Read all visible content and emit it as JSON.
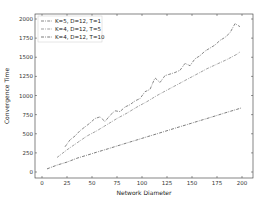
{
  "chart_data": {
    "type": "line",
    "title": "",
    "xlabel": "Network Diameter",
    "ylabel": "Convergence Time",
    "xlim": [
      -7,
      211
    ],
    "ylim": [
      -80,
      2000
    ],
    "xticks": [
      0,
      25,
      50,
      75,
      100,
      125,
      150,
      175,
      200
    ],
    "yticks": [
      0,
      250,
      500,
      750,
      1000,
      1250,
      1500,
      1750,
      2000
    ],
    "grid": false,
    "legend_position": "upper left",
    "series": [
      {
        "name": "K=5, D=12, T=1",
        "color": "#555555",
        "linestyle": "dashdot",
        "x": [
          23,
          28,
          33,
          38,
          43,
          48,
          53,
          58,
          63,
          68,
          73,
          78,
          83,
          88,
          93,
          98,
          103,
          108,
          113,
          118,
          123,
          128,
          133,
          138,
          143,
          148,
          153,
          158,
          163,
          168,
          173,
          178,
          183,
          188,
          193,
          198
        ],
        "y": [
          330,
          420,
          470,
          540,
          590,
          640,
          700,
          720,
          660,
          740,
          800,
          790,
          850,
          880,
          930,
          960,
          1050,
          1080,
          1230,
          1170,
          1260,
          1280,
          1300,
          1330,
          1420,
          1390,
          1480,
          1520,
          1580,
          1620,
          1660,
          1720,
          1760,
          1820,
          1940,
          1900
        ]
      },
      {
        "name": "K=4, D=12, T=5",
        "color": "#777777",
        "linestyle": "dashdot",
        "x": [
          15,
          25,
          35,
          45,
          55,
          65,
          75,
          85,
          95,
          105,
          115,
          125,
          135,
          145,
          155,
          165,
          175,
          185,
          195,
          198
        ],
        "y": [
          190,
          290,
          380,
          470,
          540,
          620,
          700,
          770,
          850,
          920,
          1000,
          1070,
          1140,
          1210,
          1280,
          1350,
          1410,
          1470,
          1540,
          1570
        ]
      },
      {
        "name": "K=4, D=12, T=10",
        "color": "#444444",
        "linestyle": "dashdot",
        "x": [
          5,
          15,
          25,
          35,
          45,
          55,
          65,
          75,
          85,
          95,
          105,
          115,
          125,
          135,
          145,
          155,
          165,
          175,
          185,
          195,
          200
        ],
        "y": [
          40,
          90,
          130,
          180,
          220,
          260,
          300,
          340,
          380,
          420,
          460,
          500,
          540,
          580,
          620,
          660,
          700,
          740,
          780,
          820,
          840
        ]
      }
    ]
  }
}
